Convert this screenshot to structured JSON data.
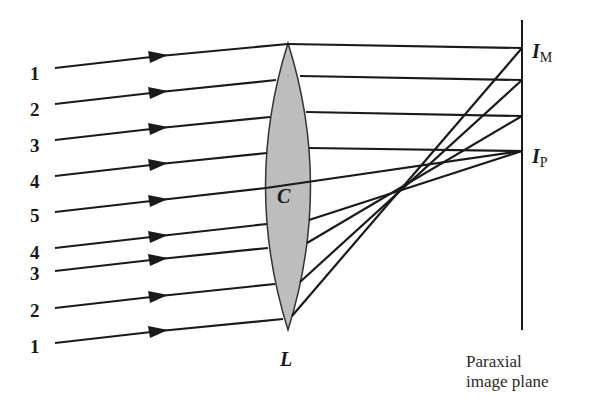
{
  "figure": {
    "lens": {
      "label": "L",
      "center_label": "C",
      "fill": "#bdbdbd",
      "outline": "#333333"
    },
    "image_points": {
      "marginal": {
        "main": "I",
        "sub": "M"
      },
      "paraxial": {
        "main": "I",
        "sub": "P"
      }
    },
    "plane_caption": {
      "line1": "Paraxial",
      "line2": "image plane"
    },
    "ray_labels": [
      "1",
      "2",
      "3",
      "4",
      "5",
      "4",
      "3",
      "2",
      "1"
    ],
    "colors": {
      "ink": "#1a1a1a",
      "lens_fill": "#bdbdbd",
      "background": "#ffffff"
    }
  }
}
